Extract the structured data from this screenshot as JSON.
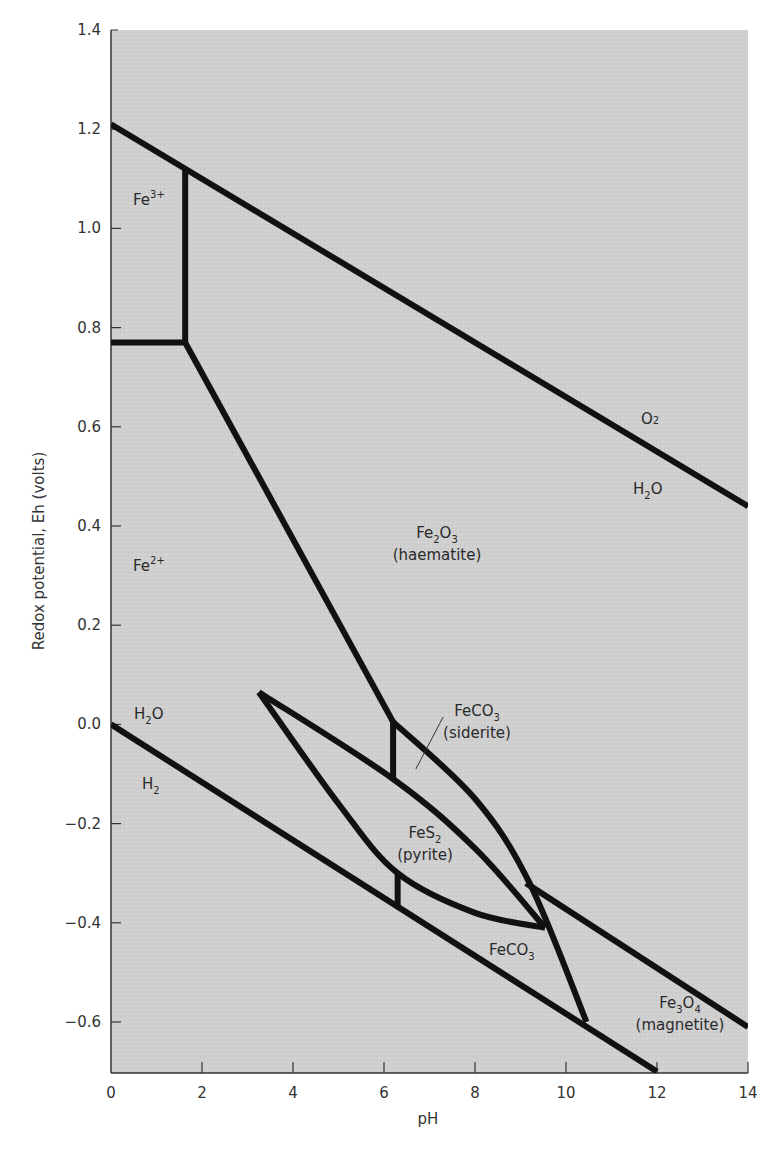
{
  "chart_data": {
    "type": "line",
    "title": "",
    "xlabel": "pH",
    "ylabel": "Redox potential, Eh (volts)",
    "xlim": [
      0,
      14
    ],
    "ylim": [
      -0.7,
      1.4
    ],
    "grid": false,
    "legend": "none",
    "x_ticks": [
      0,
      2,
      4,
      6,
      8,
      10,
      12,
      14
    ],
    "x_tick_labels": [
      "0",
      "2",
      "4",
      "6",
      "8",
      "10",
      "12",
      "14"
    ],
    "y_ticks": [
      1.4,
      1.2,
      1.0,
      0.8,
      0.6,
      0.4,
      0.2,
      0.0,
      -0.2,
      -0.4,
      -0.6
    ],
    "y_tick_labels": [
      "1.4",
      "1.2",
      "1.0",
      "0.8",
      "0.6",
      "0.4",
      "0.2",
      "0.0",
      "−0.2",
      "−0.4",
      "−0.6"
    ],
    "background_color": "#cfcfcf",
    "line_color": "#111111",
    "series": [
      {
        "name": "O2/H2O upper water stability line",
        "points": [
          [
            0,
            1.21
          ],
          [
            14,
            0.44
          ]
        ],
        "curve": false
      },
      {
        "name": "H2O/H2 lower water stability line",
        "points": [
          [
            0,
            0.0
          ],
          [
            12,
            -0.7
          ]
        ],
        "curve": false
      },
      {
        "name": "Fe3+/Fe2+ boundary",
        "points": [
          [
            0,
            0.77
          ],
          [
            1.63,
            0.77
          ]
        ],
        "curve": false
      },
      {
        "name": "Fe3+/Fe2O3 boundary",
        "points": [
          [
            1.63,
            0.77
          ],
          [
            1.63,
            1.117
          ]
        ],
        "curve": false
      },
      {
        "name": "Fe2+/Fe2O3 boundary",
        "points": [
          [
            1.63,
            0.77
          ],
          [
            6.2,
            0.005
          ]
        ],
        "curve": false
      },
      {
        "name": "Fe2+/FeCO3 boundary (upper)",
        "points": [
          [
            6.2,
            0.005
          ],
          [
            6.2,
            -0.11
          ]
        ],
        "curve": false
      },
      {
        "name": "FeCO3 siderite / Fe2O3 boundary",
        "points": [
          [
            6.2,
            0.005
          ],
          [
            8.0,
            -0.15
          ],
          [
            9.2,
            -0.32
          ],
          [
            10.45,
            -0.6
          ]
        ],
        "curve": true
      },
      {
        "name": "FeS2 pyrite field upper edge",
        "points": [
          [
            3.25,
            0.065
          ],
          [
            6.2,
            -0.11
          ],
          [
            8.0,
            -0.25
          ],
          [
            9.54,
            -0.41
          ]
        ],
        "curve": true
      },
      {
        "name": "FeS2 pyrite field lower edge",
        "points": [
          [
            3.25,
            0.065
          ],
          [
            5.0,
            -0.16
          ],
          [
            6.3,
            -0.3
          ],
          [
            8.0,
            -0.38
          ],
          [
            9.54,
            -0.41
          ]
        ],
        "curve": true
      },
      {
        "name": "Fe2+/FeCO3 boundary (lower)",
        "points": [
          [
            6.3,
            -0.3
          ],
          [
            6.3,
            -0.365
          ]
        ],
        "curve": false
      },
      {
        "name": "FeCO3/Fe3O4 magnetite boundary",
        "points": [
          [
            9.12,
            -0.32
          ],
          [
            14,
            -0.61
          ]
        ],
        "curve": false
      }
    ],
    "annotations": [
      {
        "text": "Fe",
        "sup": "3+",
        "x": 0.5,
        "y": 1.08
      },
      {
        "text": "Fe",
        "sup": "2+",
        "x": 0.5,
        "y": 0.28
      },
      {
        "text": "O",
        "sub": "2",
        "x": 11.6,
        "y": 0.63
      },
      {
        "text": "H",
        "sub": "2",
        "after": "O",
        "x": 11.5,
        "y": 0.47,
        "id": "h2o-upper"
      },
      {
        "text": "H",
        "sub": "2",
        "after": "O",
        "x": 0.5,
        "y": 0.02,
        "id": "h2o-lower"
      },
      {
        "text": "H",
        "sub": "2",
        "x": 0.7,
        "y": -0.125
      },
      {
        "text": "Fe",
        "sub": "2",
        "after": "O",
        "sub2": "3",
        "x": 7.2,
        "y": 0.365,
        "line2": "(haematite)"
      },
      {
        "text": "FeCO",
        "sub": "3",
        "x": 7.5,
        "y": 0.01,
        "line2": "(siderite)",
        "leader": [
          [
            6.7,
            -0.09
          ],
          [
            7.3,
            0.015
          ]
        ]
      },
      {
        "text": "FeS",
        "sub": "2",
        "x": 6.9,
        "y": -0.22,
        "line2": "(pyrite)"
      },
      {
        "text": "FeCO",
        "sub": "3",
        "x": 8.85,
        "y": -0.46
      },
      {
        "text": "Fe",
        "sub": "3",
        "after": "O",
        "sub2": "4",
        "x": 12.5,
        "y": -0.57,
        "line2": "(magnetite)"
      }
    ]
  },
  "labels": {
    "fe3": {
      "main": "Fe",
      "sup": "3+"
    },
    "fe2": {
      "main": "Fe",
      "sup": "2+"
    },
    "o2": {
      "main": "O",
      "sub": "2"
    },
    "h2o_upper": {
      "main": "H",
      "sub": "2",
      "tail": "O"
    },
    "h2o_lower": {
      "main": "H",
      "sub": "2",
      "tail": "O"
    },
    "h2": {
      "main": "H",
      "sub": "2"
    },
    "haematite": {
      "main": "Fe",
      "sub": "2",
      "mid": "O",
      "sub2": "3",
      "name": "(haematite)"
    },
    "siderite": {
      "main": "FeCO",
      "sub": "3",
      "name": "(siderite)"
    },
    "pyrite": {
      "main": "FeS",
      "sub": "2",
      "name": "(pyrite)"
    },
    "feco3_lower": {
      "main": "FeCO",
      "sub": "3"
    },
    "magnetite": {
      "main": "Fe",
      "sub": "3",
      "mid": "O",
      "sub2": "4",
      "name": "(magnetite)"
    }
  }
}
